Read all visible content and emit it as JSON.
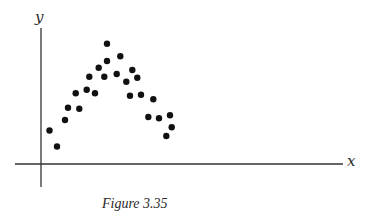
{
  "chart_data": {
    "type": "scatter",
    "title": "",
    "caption": "Figure 3.35",
    "xlabel": "x",
    "ylabel": "y",
    "grid": false,
    "legend": null,
    "ticks": {
      "x": [],
      "y": []
    },
    "axis_origin_px": {
      "x": 41,
      "y": 164
    },
    "xlim_px": [
      15,
      343
    ],
    "ylim_px": [
      28,
      187
    ],
    "points_px": [
      [
        49.5,
        130.5
      ],
      [
        57,
        146.5
      ],
      [
        65,
        120
      ],
      [
        68,
        107.7
      ],
      [
        79.3,
        108.7
      ],
      [
        75.7,
        93.3
      ],
      [
        86.7,
        89.7
      ],
      [
        95,
        93.3
      ],
      [
        89.3,
        76.7
      ],
      [
        98.7,
        67.7
      ],
      [
        104.3,
        76.7
      ],
      [
        107,
        61
      ],
      [
        107,
        43.7
      ],
      [
        116.7,
        74
      ],
      [
        120.3,
        56.3
      ],
      [
        126.3,
        81.7
      ],
      [
        132.3,
        70
      ],
      [
        137.3,
        77.7
      ],
      [
        130,
        95.7
      ],
      [
        141,
        94.7
      ],
      [
        153.3,
        99.3
      ],
      [
        148.3,
        117
      ],
      [
        159,
        118.3
      ],
      [
        170,
        115.3
      ],
      [
        171.7,
        127.3
      ],
      [
        166.3,
        136
      ]
    ]
  }
}
